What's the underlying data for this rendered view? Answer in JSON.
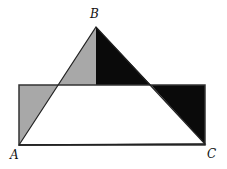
{
  "diagram": {
    "type": "geometry-figure",
    "points": {
      "A": {
        "label": "A",
        "x": 19,
        "y": 145
      },
      "B": {
        "label": "B",
        "x": 96,
        "y": 27
      },
      "C": {
        "label": "C",
        "x": 205,
        "y": 144
      }
    },
    "rectangle": {
      "x1": 19,
      "y1": 85,
      "x2": 205,
      "y2": 145
    },
    "colors": {
      "gray": "#a8a8a8",
      "black": "#0a0a0a",
      "stroke": "#222222",
      "white": "#ffffff"
    }
  },
  "labels": {
    "A": "A",
    "B": "B",
    "C": "C"
  }
}
